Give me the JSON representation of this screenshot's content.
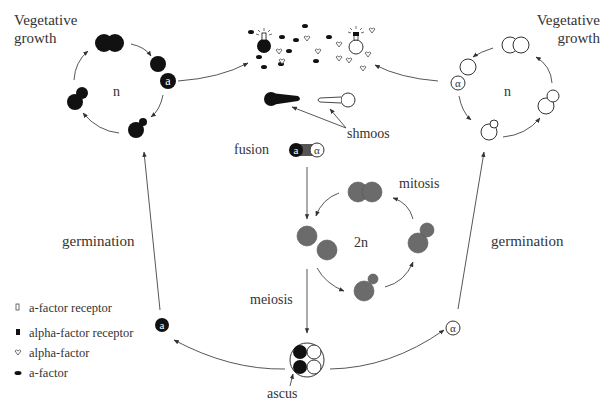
{
  "diagram": {
    "colors": {
      "mating_type_a": "#111111",
      "mating_type_alpha": "#ffffff",
      "diploid": "#6b6b6b",
      "arrow": "#444444",
      "text": "#333333"
    },
    "left_cycle": {
      "label": "Vegetative\ngrowth",
      "label_line1": "Vegetative",
      "label_line2": "growth",
      "ploidy": "n",
      "mating_type_badge": "a"
    },
    "right_cycle": {
      "label_line1": "Vegetative",
      "label_line2": "growth",
      "ploidy": "n",
      "mating_type_badge": "α"
    },
    "pheromone_exchange": {
      "shmoos_label": "shmoos"
    },
    "fusion": {
      "label": "fusion",
      "left_badge": "a",
      "right_badge": "α"
    },
    "diploid_cycle": {
      "ploidy": "2n",
      "mitosis_label": "mitosis"
    },
    "meiosis_label": "meiosis",
    "ascus_label": "ascus",
    "germination_left": "germination",
    "germination_right": "germination",
    "spore_left_badge": "a",
    "spore_right_badge": "α",
    "legend": [
      {
        "icon": "a-factor-receptor-icon",
        "label": "a-factor receptor"
      },
      {
        "icon": "alpha-factor-receptor-icon",
        "label": "alpha-factor receptor"
      },
      {
        "icon": "alpha-factor-icon",
        "label": "alpha-factor"
      },
      {
        "icon": "a-factor-icon",
        "label": "a-factor"
      }
    ]
  }
}
